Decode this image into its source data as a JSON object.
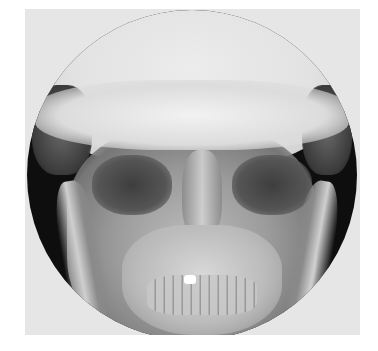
{
  "image": {
    "subject": "frontal skull radiograph",
    "view": "circular x-ray field on light film background",
    "colors": {
      "film_background": "#e6e6e6",
      "field_edge": "#0e0e0e",
      "bone_highlight": "#f2f2f2",
      "dental_filling": "#ffffff"
    }
  }
}
